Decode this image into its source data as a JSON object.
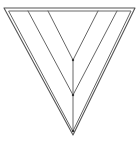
{
  "diagram": {
    "stroke_color": "#555555",
    "background": "#ffffff",
    "outer_triangle": {
      "points": [
        [
          4,
          8
        ],
        [
          135,
          8
        ],
        [
          73,
          135
        ]
      ]
    },
    "inner_outline": {
      "points": [
        [
          9,
          11
        ],
        [
          131,
          11
        ],
        [
          73,
          131
        ]
      ]
    },
    "chevron_outer": {
      "points": [
        [
          28,
          11
        ],
        [
          73,
          95
        ],
        [
          117,
          11
        ]
      ]
    },
    "chevron_inner": {
      "points": [
        [
          48,
          11
        ],
        [
          73,
          60
        ],
        [
          98,
          11
        ]
      ]
    },
    "center_line": {
      "from": [
        73,
        60
      ],
      "to": [
        73,
        131
      ]
    },
    "vertices": [
      [
        73,
        60
      ],
      [
        73,
        95
      ],
      [
        73,
        131
      ]
    ]
  }
}
